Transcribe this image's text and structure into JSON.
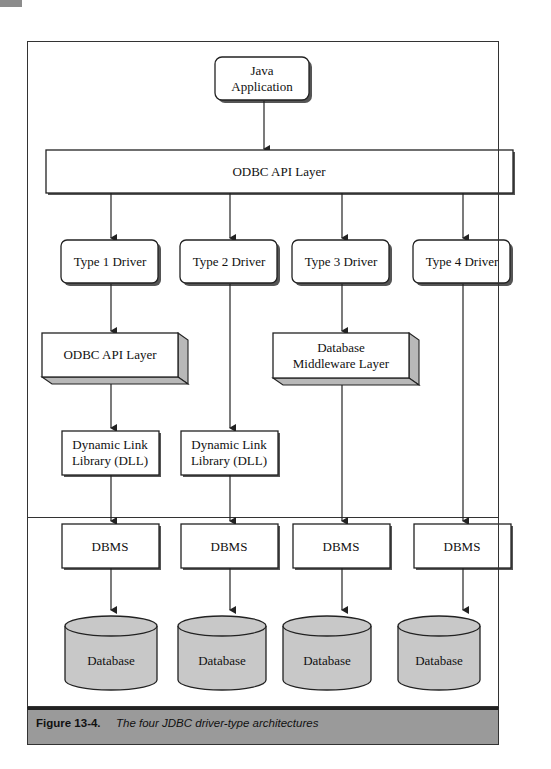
{
  "figure": {
    "label": "Figure 13-4.",
    "caption": "The four JDBC driver-type architectures"
  },
  "nodes": {
    "java_app": {
      "line1": "Java",
      "line2": "Application"
    },
    "odbc_top": {
      "label": "ODBC API Layer"
    },
    "drivers": [
      {
        "label": "Type 1 Driver"
      },
      {
        "label": "Type 2 Driver"
      },
      {
        "label": "Type 3 Driver"
      },
      {
        "label": "Type 4 Driver"
      }
    ],
    "odbc_layer": {
      "label": "ODBC API Layer"
    },
    "middleware": {
      "line1": "Database",
      "line2": "Middleware Layer"
    },
    "dll": [
      {
        "line1": "Dynamic Link",
        "line2": "Library (DLL)"
      },
      {
        "line1": "Dynamic Link",
        "line2": "Library (DLL)"
      }
    ],
    "dbms": [
      {
        "label": "DBMS"
      },
      {
        "label": "DBMS"
      },
      {
        "label": "DBMS"
      },
      {
        "label": "DBMS"
      }
    ],
    "databases": [
      {
        "label": "Database"
      },
      {
        "label": "Database"
      },
      {
        "label": "Database"
      },
      {
        "label": "Database"
      }
    ]
  },
  "colors": {
    "stroke": "#222222",
    "cylinder_fill": "#c8c8c8",
    "shadow": "#666666",
    "caption_bg": "#9a9a9a"
  }
}
